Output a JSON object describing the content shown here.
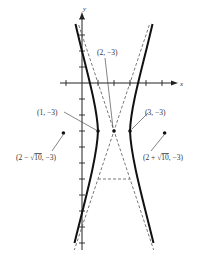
{
  "figure": {
    "type": "hyperbola-graph",
    "equation_form": "(x - 2)^2 / 1 - (y + 3)^2 / 9 = 1",
    "axes": {
      "x_label": "x",
      "y_label": "y",
      "origin_px": [
        82,
        83
      ],
      "unit_px": 16,
      "x_ticks": [
        -1,
        1,
        2,
        3,
        4,
        5
      ],
      "y_ticks": [
        4,
        3,
        2,
        1,
        -1,
        -2,
        -3,
        -4,
        -5,
        -6,
        -7,
        -8,
        -9,
        -10
      ]
    },
    "center": {
      "label": "(2, −3)",
      "x": 2,
      "y": -3
    },
    "vertices": [
      {
        "label": "(1, −3)",
        "x": 1,
        "y": -3
      },
      {
        "label": "(3, −3)",
        "x": 3,
        "y": -3
      }
    ],
    "foci": [
      {
        "label_prefix": "(2 − ",
        "label_radical": "10",
        "label_suffix": ", −3)",
        "x": -1.162,
        "y": -3
      },
      {
        "label_prefix": "(2 + ",
        "label_radical": "10",
        "label_suffix": ", −3)",
        "x": 5.162,
        "y": -3
      }
    ],
    "asymptotes": [
      "y + 3 = 3(x − 2)",
      "y + 3 = −3(x − 2)"
    ],
    "colors": {
      "curve": "#111111",
      "dashed": "#555555",
      "axis": "#222222",
      "text": "#333333"
    }
  }
}
